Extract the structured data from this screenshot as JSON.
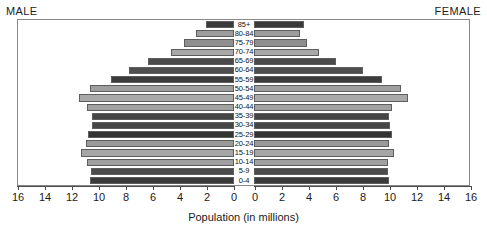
{
  "labels": {
    "male": "MALE",
    "female": "FEMALE",
    "x_axis_title": "Population (in millions)"
  },
  "chart_data": {
    "type": "bar",
    "subtype": "population-pyramid",
    "title": "",
    "xlabel": "Population (in millions)",
    "ylabel": "",
    "grid": false,
    "legend": "none",
    "axis_ticks_left": [
      16,
      14,
      12,
      10,
      8,
      6,
      4,
      2,
      0
    ],
    "axis_ticks_right": [
      0,
      2,
      4,
      6,
      8,
      10,
      12,
      14,
      16
    ],
    "xlim_left": [
      16,
      0
    ],
    "xlim_right": [
      0,
      16
    ],
    "categories": [
      "85+",
      "80-84",
      "75-79",
      "70-74",
      "65-69",
      "60-64",
      "55-59",
      "50-54",
      "45-49",
      "40-44",
      "35-39",
      "30-34",
      "25-29",
      "20-24",
      "15-19",
      "10-14",
      "5-9",
      "0-4"
    ],
    "series": [
      {
        "name": "MALE",
        "side": "left",
        "values": [
          2.1,
          2.8,
          3.7,
          4.7,
          6.4,
          7.8,
          9.1,
          10.7,
          11.5,
          10.9,
          10.5,
          10.5,
          10.8,
          11.0,
          11.3,
          10.9,
          10.6,
          10.7
        ]
      },
      {
        "name": "FEMALE",
        "side": "right",
        "values": [
          3.7,
          3.4,
          3.9,
          4.8,
          6.1,
          8.1,
          9.5,
          10.9,
          11.4,
          10.2,
          10.0,
          10.1,
          10.2,
          10.0,
          10.4,
          9.9,
          9.9,
          10.0
        ]
      }
    ],
    "bar_shades": [
      "#3a3a3a",
      "#9c9c9c",
      "#8f8f8f",
      "#a8a8a8",
      "#4a4a4a",
      "#4f4f4f",
      "#3b3b3b",
      "#9e9e9e",
      "#a9a9a9",
      "#a2a2a2",
      "#454545",
      "#464646",
      "#333333",
      "#9a9a9a",
      "#a6a6a6",
      "#a0a0a0",
      "#4c4c4c",
      "#3a3a3a"
    ]
  }
}
